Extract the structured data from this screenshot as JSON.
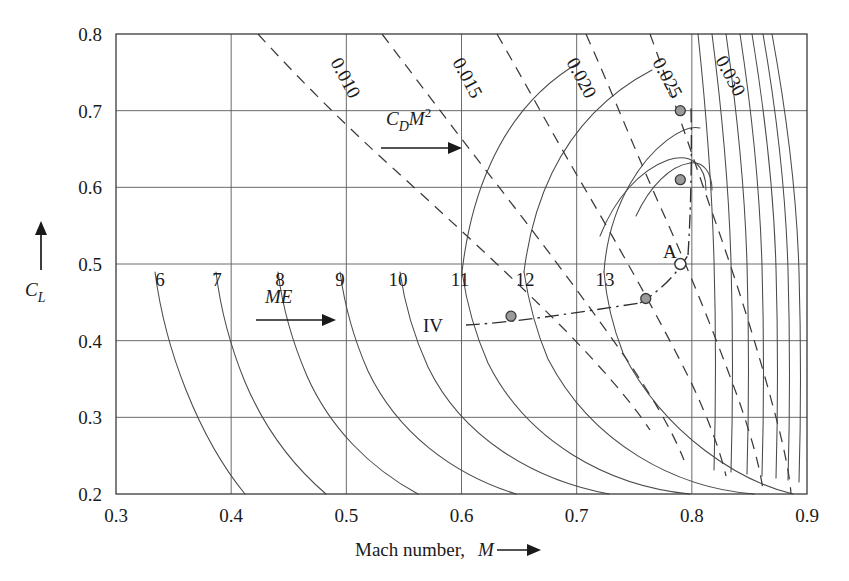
{
  "chart_data": {
    "type": "line",
    "title": "",
    "xlabel": "Mach number, M",
    "ylabel": "C_L",
    "xlim": [
      0.3,
      0.9
    ],
    "ylim": [
      0.2,
      0.8
    ],
    "xticks": [
      "0.3",
      "0.4",
      "0.5",
      "0.6",
      "0.7",
      "0.8",
      "0.9"
    ],
    "xtick_values": [
      0.3,
      0.4,
      0.5,
      0.6,
      0.7,
      0.8,
      0.9
    ],
    "yticks": [
      "0.2",
      "0.3",
      "0.4",
      "0.5",
      "0.6",
      "0.7",
      "0.8"
    ],
    "ytick_values": [
      0.2,
      0.3,
      0.4,
      0.5,
      0.6,
      0.7,
      0.8
    ],
    "grid": true,
    "legend": "none",
    "series": [
      {
        "name": "ME-contours",
        "style": "solid",
        "direction_label": "ME",
        "labels": [
          "6",
          "7",
          "8",
          "9",
          "10",
          "11",
          "12",
          "13"
        ],
        "label_values": [
          6,
          7,
          8,
          9,
          10,
          11,
          12,
          13
        ],
        "note": "Solid contours of constant Mach-number times aerodynamic efficiency (ME); values increase to the right."
      },
      {
        "name": "CDM2-contours",
        "style": "dashed",
        "direction_label": "C_D M^2",
        "labels": [
          "0.010",
          "0.015",
          "0.020",
          "0.025",
          "0.030"
        ],
        "label_values": [
          0.01,
          0.015,
          0.02,
          0.025,
          0.03
        ],
        "note": "Dashed contours of constant C_D M squared; values increase to the right."
      },
      {
        "name": "IV-path",
        "style": "dash-dot",
        "direction_label": "IV",
        "note": "Dash-dot path linking operating points."
      }
    ],
    "points": [
      {
        "label": "A",
        "x": 0.79,
        "y": 0.5,
        "marker": "open-circle"
      },
      {
        "label": "",
        "x": 0.79,
        "y": 0.7,
        "marker": "filled-circle"
      },
      {
        "label": "",
        "x": 0.79,
        "y": 0.61,
        "marker": "filled-circle"
      },
      {
        "label": "",
        "x": 0.76,
        "y": 0.455,
        "marker": "filled-circle"
      },
      {
        "label": "IV",
        "x": 0.643,
        "y": 0.432,
        "marker": "filled-circle"
      }
    ],
    "annotations": [
      {
        "text": "C_D M^2",
        "kind": "direction-arrow",
        "x": 0.45,
        "y": 0.69
      },
      {
        "text": "ME",
        "kind": "direction-arrow",
        "x": 0.415,
        "y": 0.455
      },
      {
        "text": "A",
        "kind": "point-label",
        "x": 0.775,
        "y": 0.525
      },
      {
        "text": "IV",
        "kind": "point-label",
        "x": 0.598,
        "y": 0.432
      }
    ]
  },
  "axis": {
    "x_title_text": "Mach number,",
    "x_title_symbol": "M",
    "x_arrow": "⟶",
    "y_title_symbol_main": "C",
    "y_title_symbol_sub": "L",
    "y_arrow": "↑"
  },
  "labels": {
    "me_main": "ME",
    "cdm2_main": "C",
    "cdm2_sub": "D",
    "cdm2_var": "M",
    "cdm2_exp": "2",
    "point_a": "A",
    "point_iv": "IV"
  },
  "colors": {
    "background": "#ffffff",
    "axis": "#3a3a3a",
    "grid": "#5a5a5a",
    "contour_solid": "#4a4a4a",
    "contour_dashed": "#3a3a3a",
    "marker_fill": "#9a9a9a",
    "marker_stroke": "#3a3a3a",
    "text": "#1a1a1a"
  }
}
